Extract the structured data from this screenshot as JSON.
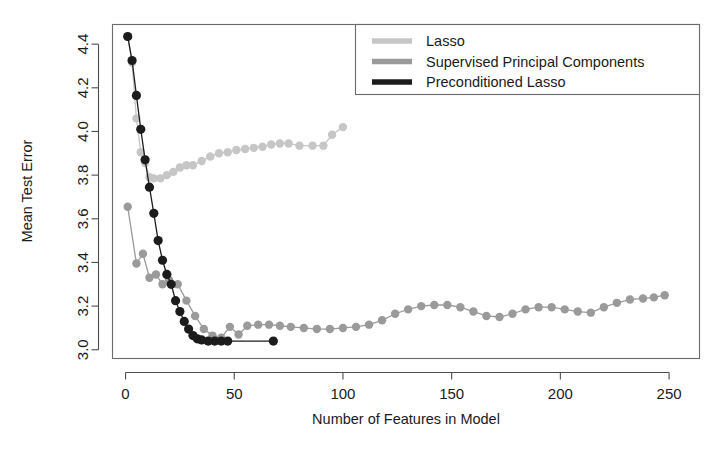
{
  "chart_data": {
    "type": "line",
    "title": "",
    "xlabel": "Number of Features in Model",
    "ylabel": "Mean Test Error",
    "xlim": [
      -6,
      264
    ],
    "ylim": [
      2.96,
      4.49
    ],
    "xticks": [
      0,
      50,
      100,
      150,
      200,
      250
    ],
    "xticklabels": [
      "0",
      "50",
      "100",
      "150",
      "200",
      "250"
    ],
    "yticks": [
      3.0,
      3.2,
      3.4,
      3.6,
      3.8,
      4.0,
      4.2,
      4.4
    ],
    "yticklabels": [
      "3.0",
      "3.2",
      "3.4",
      "3.6",
      "3.8",
      "4.0",
      "4.2",
      "4.4"
    ],
    "grid": false,
    "legend_position": "top-right",
    "markers": "filled-circle",
    "series": [
      {
        "name": "Lasso",
        "color": "#c6c6c6",
        "points": [
          [
            1,
            4.435
          ],
          [
            3,
            4.315
          ],
          [
            5,
            4.06
          ],
          [
            7,
            3.905
          ],
          [
            9,
            3.855
          ],
          [
            11,
            3.79
          ],
          [
            13,
            3.785
          ],
          [
            16,
            3.785
          ],
          [
            19,
            3.8
          ],
          [
            22,
            3.815
          ],
          [
            25,
            3.835
          ],
          [
            28,
            3.845
          ],
          [
            31,
            3.845
          ],
          [
            35,
            3.865
          ],
          [
            39,
            3.885
          ],
          [
            43,
            3.9
          ],
          [
            47,
            3.905
          ],
          [
            51,
            3.915
          ],
          [
            55,
            3.92
          ],
          [
            59,
            3.925
          ],
          [
            63,
            3.93
          ],
          [
            67,
            3.94
          ],
          [
            71,
            3.945
          ],
          [
            75,
            3.945
          ],
          [
            80,
            3.935
          ],
          [
            86,
            3.935
          ],
          [
            91,
            3.935
          ],
          [
            95,
            3.985
          ],
          [
            100,
            4.02
          ]
        ]
      },
      {
        "name": "Supervised Principal Components",
        "color": "#9a9a9a",
        "points": [
          [
            1,
            3.655
          ],
          [
            5,
            3.395
          ],
          [
            8,
            3.44
          ],
          [
            11,
            3.33
          ],
          [
            14,
            3.345
          ],
          [
            17,
            3.3
          ],
          [
            20,
            3.32
          ],
          [
            24,
            3.3
          ],
          [
            28,
            3.225
          ],
          [
            32,
            3.155
          ],
          [
            36,
            3.095
          ],
          [
            40,
            3.065
          ],
          [
            44,
            3.055
          ],
          [
            48,
            3.105
          ],
          [
            52,
            3.07
          ],
          [
            56,
            3.11
          ],
          [
            61,
            3.115
          ],
          [
            66,
            3.115
          ],
          [
            71,
            3.11
          ],
          [
            76,
            3.105
          ],
          [
            82,
            3.1
          ],
          [
            88,
            3.095
          ],
          [
            94,
            3.095
          ],
          [
            100,
            3.1
          ],
          [
            106,
            3.105
          ],
          [
            112,
            3.115
          ],
          [
            118,
            3.135
          ],
          [
            124,
            3.165
          ],
          [
            130,
            3.185
          ],
          [
            136,
            3.2
          ],
          [
            142,
            3.205
          ],
          [
            148,
            3.205
          ],
          [
            154,
            3.195
          ],
          [
            160,
            3.175
          ],
          [
            166,
            3.155
          ],
          [
            172,
            3.15
          ],
          [
            178,
            3.165
          ],
          [
            184,
            3.185
          ],
          [
            190,
            3.195
          ],
          [
            196,
            3.195
          ],
          [
            202,
            3.185
          ],
          [
            208,
            3.175
          ],
          [
            214,
            3.17
          ],
          [
            220,
            3.195
          ],
          [
            226,
            3.215
          ],
          [
            232,
            3.23
          ],
          [
            238,
            3.235
          ],
          [
            243,
            3.24
          ],
          [
            248,
            3.25
          ]
        ]
      },
      {
        "name": "Preconditioned Lasso",
        "color": "#1c1c1c",
        "points": [
          [
            1,
            4.435
          ],
          [
            3,
            4.325
          ],
          [
            5,
            4.165
          ],
          [
            7,
            4.01
          ],
          [
            9,
            3.87
          ],
          [
            11,
            3.745
          ],
          [
            13,
            3.625
          ],
          [
            15,
            3.5
          ],
          [
            17,
            3.41
          ],
          [
            19,
            3.345
          ],
          [
            21,
            3.3
          ],
          [
            23,
            3.225
          ],
          [
            25,
            3.175
          ],
          [
            27,
            3.13
          ],
          [
            29,
            3.095
          ],
          [
            31,
            3.065
          ],
          [
            33,
            3.05
          ],
          [
            35,
            3.045
          ],
          [
            38,
            3.04
          ],
          [
            41,
            3.04
          ],
          [
            44,
            3.04
          ],
          [
            47,
            3.04
          ],
          [
            68,
            3.04
          ]
        ]
      }
    ]
  },
  "legend": {
    "entries": [
      {
        "label": "Lasso",
        "color": "#c6c6c6"
      },
      {
        "label": "Supervised Principal Components",
        "color": "#9a9a9a"
      },
      {
        "label": "Preconditioned Lasso",
        "color": "#1c1c1c"
      }
    ]
  }
}
